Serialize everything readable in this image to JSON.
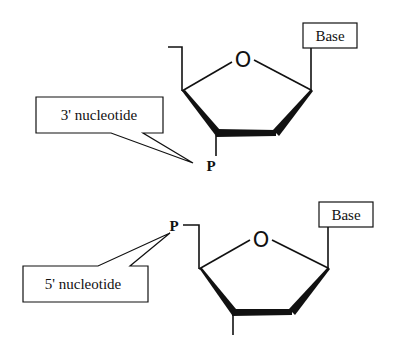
{
  "diagram": {
    "top": {
      "base_label": "Base",
      "ring_oxygen": "O",
      "phosphate": "P",
      "callout": "3' nucleotide"
    },
    "bottom": {
      "base_label": "Base",
      "ring_oxygen": "O",
      "phosphate": "P",
      "callout": "5' nucleotide"
    },
    "colors": {
      "ink": "#111111",
      "background": "#ffffff"
    }
  }
}
